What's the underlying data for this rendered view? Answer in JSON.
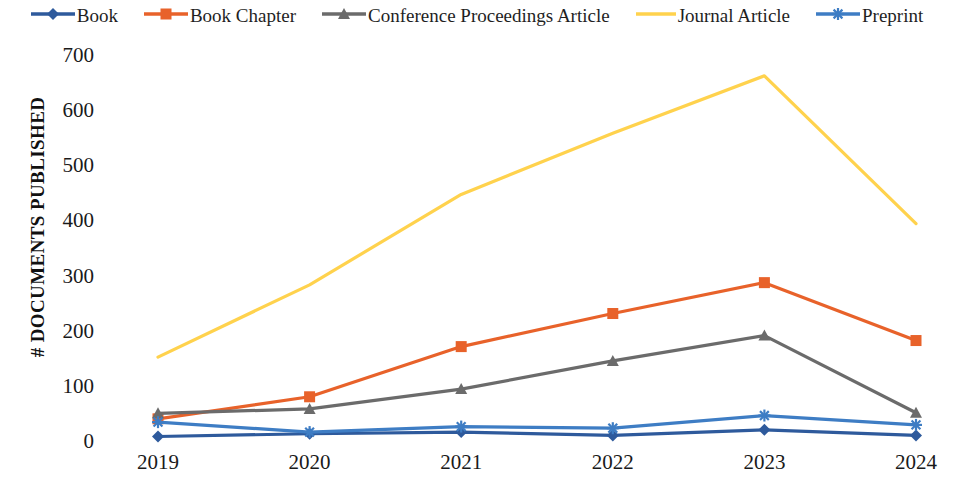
{
  "chart_data": {
    "type": "line",
    "title": "",
    "xlabel": "",
    "ylabel": "# DOCUMENTS PUBLISHED",
    "categories": [
      "2019",
      "2020",
      "2021",
      "2022",
      "2023",
      "2024"
    ],
    "x": [
      2019,
      2020,
      2021,
      2022,
      2023,
      2024
    ],
    "ylim": [
      0,
      700
    ],
    "yticks": [
      0,
      100,
      200,
      300,
      400,
      500,
      600,
      700
    ],
    "ytick_labels": [
      "0",
      "100",
      "200",
      "300",
      "400",
      "500",
      "600",
      "700"
    ],
    "grid": false,
    "legend_position": "top",
    "series": [
      {
        "name": "Book",
        "color": "#2E5A9C",
        "marker": "diamond",
        "values": [
          10,
          15,
          18,
          12,
          22,
          12
        ]
      },
      {
        "name": "Book Chapter",
        "color": "#E8622A",
        "marker": "square",
        "values": [
          42,
          82,
          173,
          233,
          289,
          184
        ]
      },
      {
        "name": "Conference Proceedings Article",
        "color": "#6B6B6B",
        "marker": "triangle",
        "values": [
          52,
          60,
          96,
          147,
          193,
          53
        ]
      },
      {
        "name": "Journal Article",
        "color": "#FFD24D",
        "marker": "none",
        "values": [
          154,
          285,
          449,
          560,
          664,
          396
        ]
      },
      {
        "name": "Preprint",
        "color": "#3E7DC4",
        "marker": "asterisk",
        "values": [
          36,
          18,
          28,
          25,
          48,
          31
        ]
      }
    ]
  },
  "legend": {
    "items": [
      {
        "label": "Book",
        "color": "#2E5A9C",
        "marker": "diamond"
      },
      {
        "label": "Book Chapter",
        "color": "#E8622A",
        "marker": "square"
      },
      {
        "label": "Conference Proceedings Article",
        "color": "#6B6B6B",
        "marker": "triangle"
      },
      {
        "label": "Journal Article",
        "color": "#FFD24D",
        "marker": "none"
      },
      {
        "label": "Preprint",
        "color": "#3E7DC4",
        "marker": "asterisk"
      }
    ]
  }
}
